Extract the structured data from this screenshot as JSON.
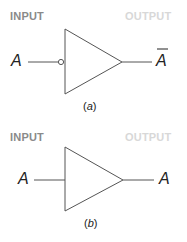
{
  "diagrams": [
    {
      "id": "a",
      "input_header": "INPUT",
      "output_header": "OUTPUT",
      "input_signal": "A",
      "output_signal": "A",
      "output_overbar": true,
      "gate": "inverter (NOT gate with input bubble)",
      "caption_open": "(",
      "caption_letter": "a",
      "caption_close": ")"
    },
    {
      "id": "b",
      "input_header": "INPUT",
      "output_header": "OUTPUT",
      "input_signal": "A",
      "output_signal": "A",
      "output_overbar": false,
      "gate": "buffer",
      "caption_open": "(",
      "caption_letter": "b",
      "caption_close": ")"
    }
  ],
  "colors": {
    "input_header": "#8a8a8a",
    "output_header": "#d8d8d8",
    "lines": "#555555",
    "text": "#222222"
  }
}
